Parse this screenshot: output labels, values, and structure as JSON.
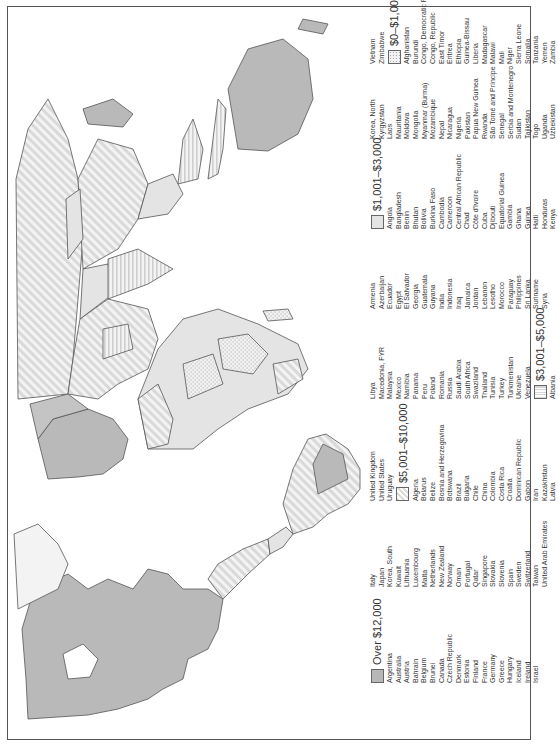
{
  "map": {
    "title": "World GDP per capita map",
    "orientation": "rotated 90 degrees counter-clockwise"
  },
  "legend": {
    "categories": [
      {
        "key": "over_12000",
        "label": "Over $12,000",
        "pattern": "solid-dark-gray",
        "color": "#b7b7b7",
        "countries": [
          "Argentina",
          "Australia",
          "Austria",
          "Bahrain",
          "Belgium",
          "Brunei",
          "Canada",
          "Czech Republic",
          "Denmark",
          "Estonia",
          "Finland",
          "France",
          "Germany",
          "Greece",
          "Hungary",
          "Iceland",
          "Ireland",
          "Israel",
          "Italy",
          "Japan",
          "Korea, South",
          "Kuwait",
          "Lithuania",
          "Luxembourg",
          "Malta",
          "Netherlands",
          "New Zealand",
          "Norway",
          "Oman",
          "Portugal",
          "Qatar",
          "Singapore",
          "Slovakia",
          "Slovenia",
          "Spain",
          "Sweden",
          "Switzerland",
          "Taiwan",
          "United Arab Emirates",
          "United Kingdom",
          "United States",
          "Uruguay"
        ]
      },
      {
        "key": "5001_10000",
        "label": "$5,001–$10,000",
        "pattern": "diagonal-stripes",
        "color": "#dcdcdc",
        "countries": [
          "Algeria",
          "Belarus",
          "Belize",
          "Bosnia and Herzegovina",
          "Botswana",
          "Brazil",
          "Bulgaria",
          "Chile",
          "China",
          "Colombia",
          "Costa Rica",
          "Croatia",
          "Dominican Republic",
          "Gabon",
          "Iran",
          "Kazakhstan",
          "Latvia",
          "Libya",
          "Macedonia, FYR",
          "Malaysia",
          "Mexico",
          "Namibia",
          "Panama",
          "Peru",
          "Poland",
          "Romania",
          "Russia",
          "Saudi Arabia",
          "South Africa",
          "Swaziland",
          "Thailand",
          "Tunisia",
          "Turkey",
          "Turkmenistan",
          "Ukraine",
          "Venezuela"
        ]
      },
      {
        "key": "3001_5000",
        "label": "$3,001–$5,000",
        "pattern": "horizontal-stripes",
        "color": "#d6d6d6",
        "countries": [
          "Albania",
          "Armenia",
          "Azerbaijan",
          "Ecuador",
          "Egypt",
          "El Salvador",
          "Georgia",
          "Guatemala",
          "Guyana",
          "India",
          "Indonesia",
          "Iraq",
          "Jamaica",
          "Jordan",
          "Lebanon",
          "Lesotho",
          "Morocco",
          "Paraguay",
          "Philippines",
          "Sri Lanka",
          "Suriname",
          "Syria"
        ]
      },
      {
        "key": "1001_3000",
        "label": "$1,001–$3,000",
        "pattern": "solid-light-gray",
        "color": "#e4e4e4",
        "countries": [
          "Angola",
          "Bangladesh",
          "Benin",
          "Bhutan",
          "Bolivia",
          "Burkina Faso",
          "Cambodia",
          "Cameroon",
          "Central African Republic",
          "Chad",
          "Côte d'Ivoire",
          "Cuba",
          "Djibouti",
          "Equatorial Guinea",
          "Gambia",
          "Ghana",
          "Guinea",
          "Haiti",
          "Honduras",
          "Kenya",
          "Korea, North",
          "Kyrgyzstan",
          "Laos",
          "Mauritania",
          "Moldova",
          "Mongolia",
          "Myanmar (Burma)",
          "Mozambique",
          "Nepal",
          "Nicaragua",
          "Nigeria",
          "Pakistan",
          "Papua New Guinea",
          "Rwanda",
          "São Tomé and Príncipe",
          "Senegal",
          "Serbia and Montenegro",
          "Sudan",
          "Tajikistan",
          "Togo",
          "Uganda",
          "Uzbekistan",
          "Vietnam",
          "Zimbabwe"
        ]
      },
      {
        "key": "0_1000",
        "label": "$0–$1,000",
        "pattern": "dots",
        "color": "#f2f2f2",
        "countries": [
          "Afghanistan",
          "Burundi",
          "Congo, Democratic Republic",
          "Congo, Republic",
          "East Timor",
          "Eritrea",
          "Ethiopia",
          "Guinea-Bissau",
          "Liberia",
          "Madagascar",
          "Malawi",
          "Mali",
          "Niger",
          "Sierra Leone",
          "Somalia",
          "Tanzania",
          "Yemen",
          "Zambia"
        ]
      }
    ],
    "columns": [
      {
        "type": "header",
        "cat": 0
      },
      {
        "type": "list",
        "items": [
          "Argentina",
          "Australia",
          "Austria",
          "Bahrain",
          "Belgium",
          "Brunei",
          "Canada",
          "Czech Republic",
          "Denmark",
          "Estonia",
          "Finland",
          "France",
          "Germany",
          "Greece",
          "Hungary",
          "Iceland",
          "Ireland",
          "Israel"
        ]
      }
    ]
  }
}
